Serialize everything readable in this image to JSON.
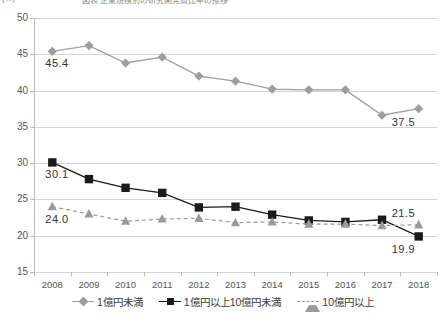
{
  "header": {
    "clipped_left": "(%)",
    "clipped_right": "図表  企業規模別の研究開発費比率の推移"
  },
  "chart_data": {
    "type": "line",
    "title": "",
    "xlabel": "",
    "ylabel": "",
    "ylim": [
      15,
      50
    ],
    "ytick_step": 5,
    "grid": true,
    "legend_position": "bottom",
    "categories": [
      "2008",
      "2009",
      "2010",
      "2011",
      "2012",
      "2013",
      "2014",
      "2015",
      "2016",
      "2017",
      "2018"
    ],
    "yticks": [
      "50",
      "45",
      "40",
      "35",
      "30",
      "25",
      "20",
      "15"
    ],
    "series": [
      {
        "name": "1億円未満",
        "marker": "diamond",
        "color": "#9d9d9d",
        "linestyle": "solid",
        "values": [
          45.4,
          46.2,
          43.8,
          44.6,
          42.0,
          41.3,
          40.2,
          40.1,
          40.1,
          36.6,
          37.5
        ],
        "labels": [
          {
            "index": 0,
            "text": "45.4",
            "anchor": "below-left"
          },
          {
            "index": 10,
            "text": "37.5",
            "anchor": "below-right"
          }
        ]
      },
      {
        "name": "1億円以上10億円未満",
        "marker": "square",
        "color": "#1a1a1a",
        "linestyle": "solid",
        "values": [
          30.1,
          27.8,
          26.6,
          25.9,
          23.9,
          24.0,
          22.9,
          22.1,
          21.9,
          22.2,
          19.9
        ],
        "labels": [
          {
            "index": 0,
            "text": "30.1",
            "anchor": "below-left"
          },
          {
            "index": 10,
            "text": "19.9",
            "anchor": "below-right"
          }
        ]
      },
      {
        "name": "10億円以上",
        "marker": "triangle",
        "color": "#9a9a9a",
        "linestyle": "dashed",
        "values": [
          24.0,
          23.0,
          22.0,
          22.3,
          22.4,
          21.8,
          21.9,
          21.6,
          21.6,
          21.4,
          21.5
        ],
        "labels": [
          {
            "index": 0,
            "text": "24.0",
            "anchor": "below-left"
          },
          {
            "index": 10,
            "text": "21.5",
            "anchor": "above-right"
          }
        ]
      }
    ]
  },
  "legend": {
    "items": [
      {
        "label": "1億円未満",
        "marker": "diamond",
        "color": "#9d9d9d",
        "linestyle": "solid"
      },
      {
        "label": "1億円以上10億円未満",
        "marker": "square",
        "color": "#1a1a1a",
        "linestyle": "solid"
      },
      {
        "label": "10億円以上",
        "marker": "triangle",
        "color": "#9a9a9a",
        "linestyle": "dashed"
      }
    ]
  }
}
